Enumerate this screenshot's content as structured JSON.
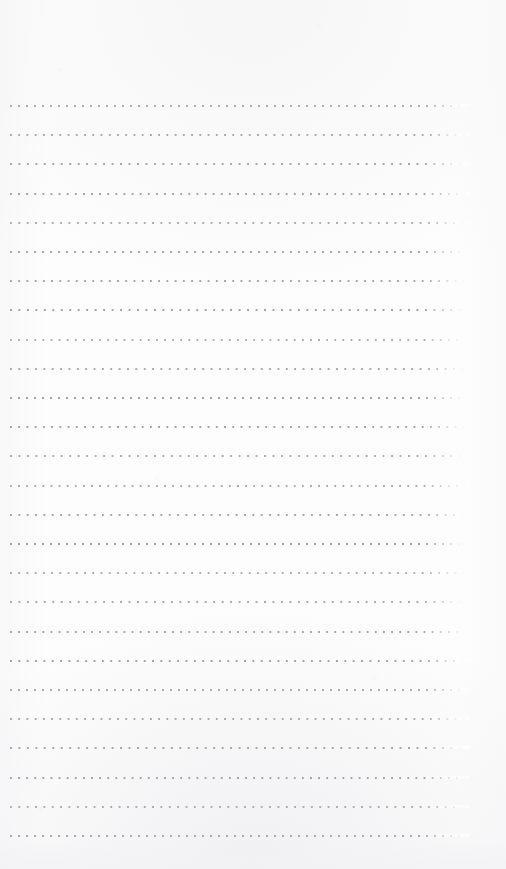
{
  "document": {
    "kind": "dotted-rule-notepaper",
    "title": "Blank dotted line paper",
    "page_width": 506,
    "page_height": 869,
    "body_text": "",
    "header_text": "",
    "footer_text": "",
    "page_number": ""
  },
  "colors": {
    "page_background": "#fdfdfd",
    "paper_tint": "#f4f4f6",
    "dot": "#9a9aa2",
    "dot_soft": "#b8b8c0",
    "bottom_shade": "#f2f2f5"
  },
  "ruling": {
    "style": "dotted",
    "line_count": 26,
    "first_line_y": 105,
    "last_line_y": 835,
    "line_spacing": 29.2,
    "left_margin": 10,
    "right_margin": 36,
    "rule_width": 460,
    "dot_pitch": 8,
    "dot_size": 2,
    "dots_per_line": 58,
    "top_margin": 105,
    "bottom_margin": 34
  },
  "regions": {
    "top_margin_label": "top margin",
    "writing_area_label": "writing area",
    "bottom_margin_label": "bottom margin"
  }
}
